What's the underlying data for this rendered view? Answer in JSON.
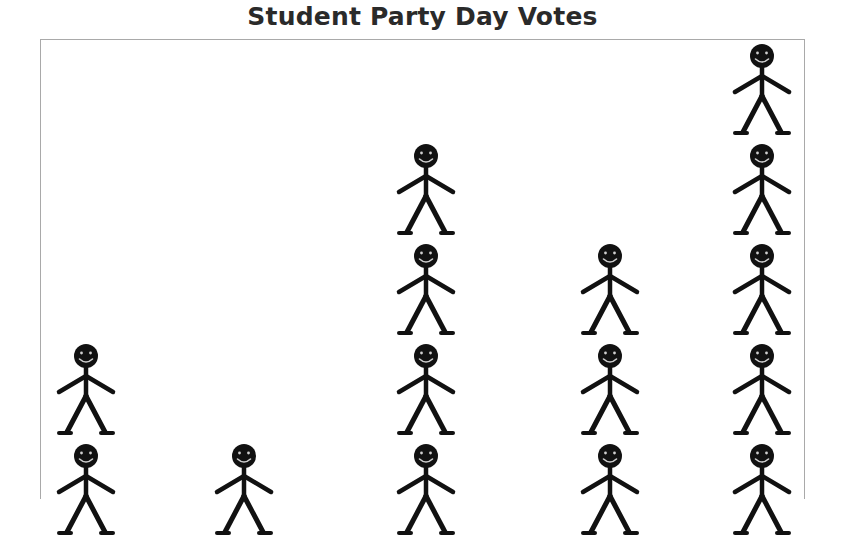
{
  "title": "Student Party Day Votes",
  "chart_data": {
    "type": "pictograph",
    "title": "Student Party Day Votes",
    "icon": "stick-figure-person",
    "note": "Image is cropped at the bottom; category labels and key are not visible. Counts are visible figures per column (bottom row partially cut off).",
    "categories": [
      "",
      "",
      "",
      "",
      ""
    ],
    "values": [
      2,
      1,
      4,
      3,
      5
    ],
    "xlabel": "",
    "ylabel": "",
    "grid": false,
    "legend": null
  },
  "colors": {
    "icon": "#111111",
    "frame": "#a9a9a9",
    "title": "#2a2a2a",
    "background": "#ffffff"
  },
  "layout": {
    "column_centers_x": [
      86,
      244,
      426,
      610,
      762
    ],
    "row_tops_y": [
      444,
      344,
      244,
      144,
      44
    ]
  }
}
